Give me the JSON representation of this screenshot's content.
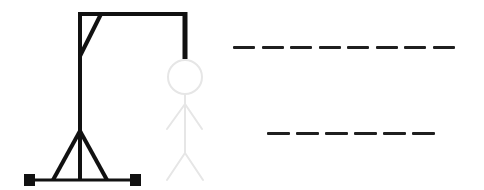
{
  "game": {
    "type": "hangman",
    "colors": {
      "gallows": "#111111",
      "figure": "#e6e6e6",
      "blank": "#1f1f1f",
      "background": "#ffffff"
    },
    "figure_parts": [
      "head",
      "body",
      "left-arm",
      "right-arm",
      "left-leg",
      "right-leg"
    ],
    "words": [
      {
        "length": 8,
        "letters": [
          "",
          "",
          "",
          "",
          "",
          "",
          "",
          ""
        ]
      },
      {
        "length": 6,
        "letters": [
          "",
          "",
          "",
          "",
          "",
          ""
        ]
      }
    ]
  }
}
